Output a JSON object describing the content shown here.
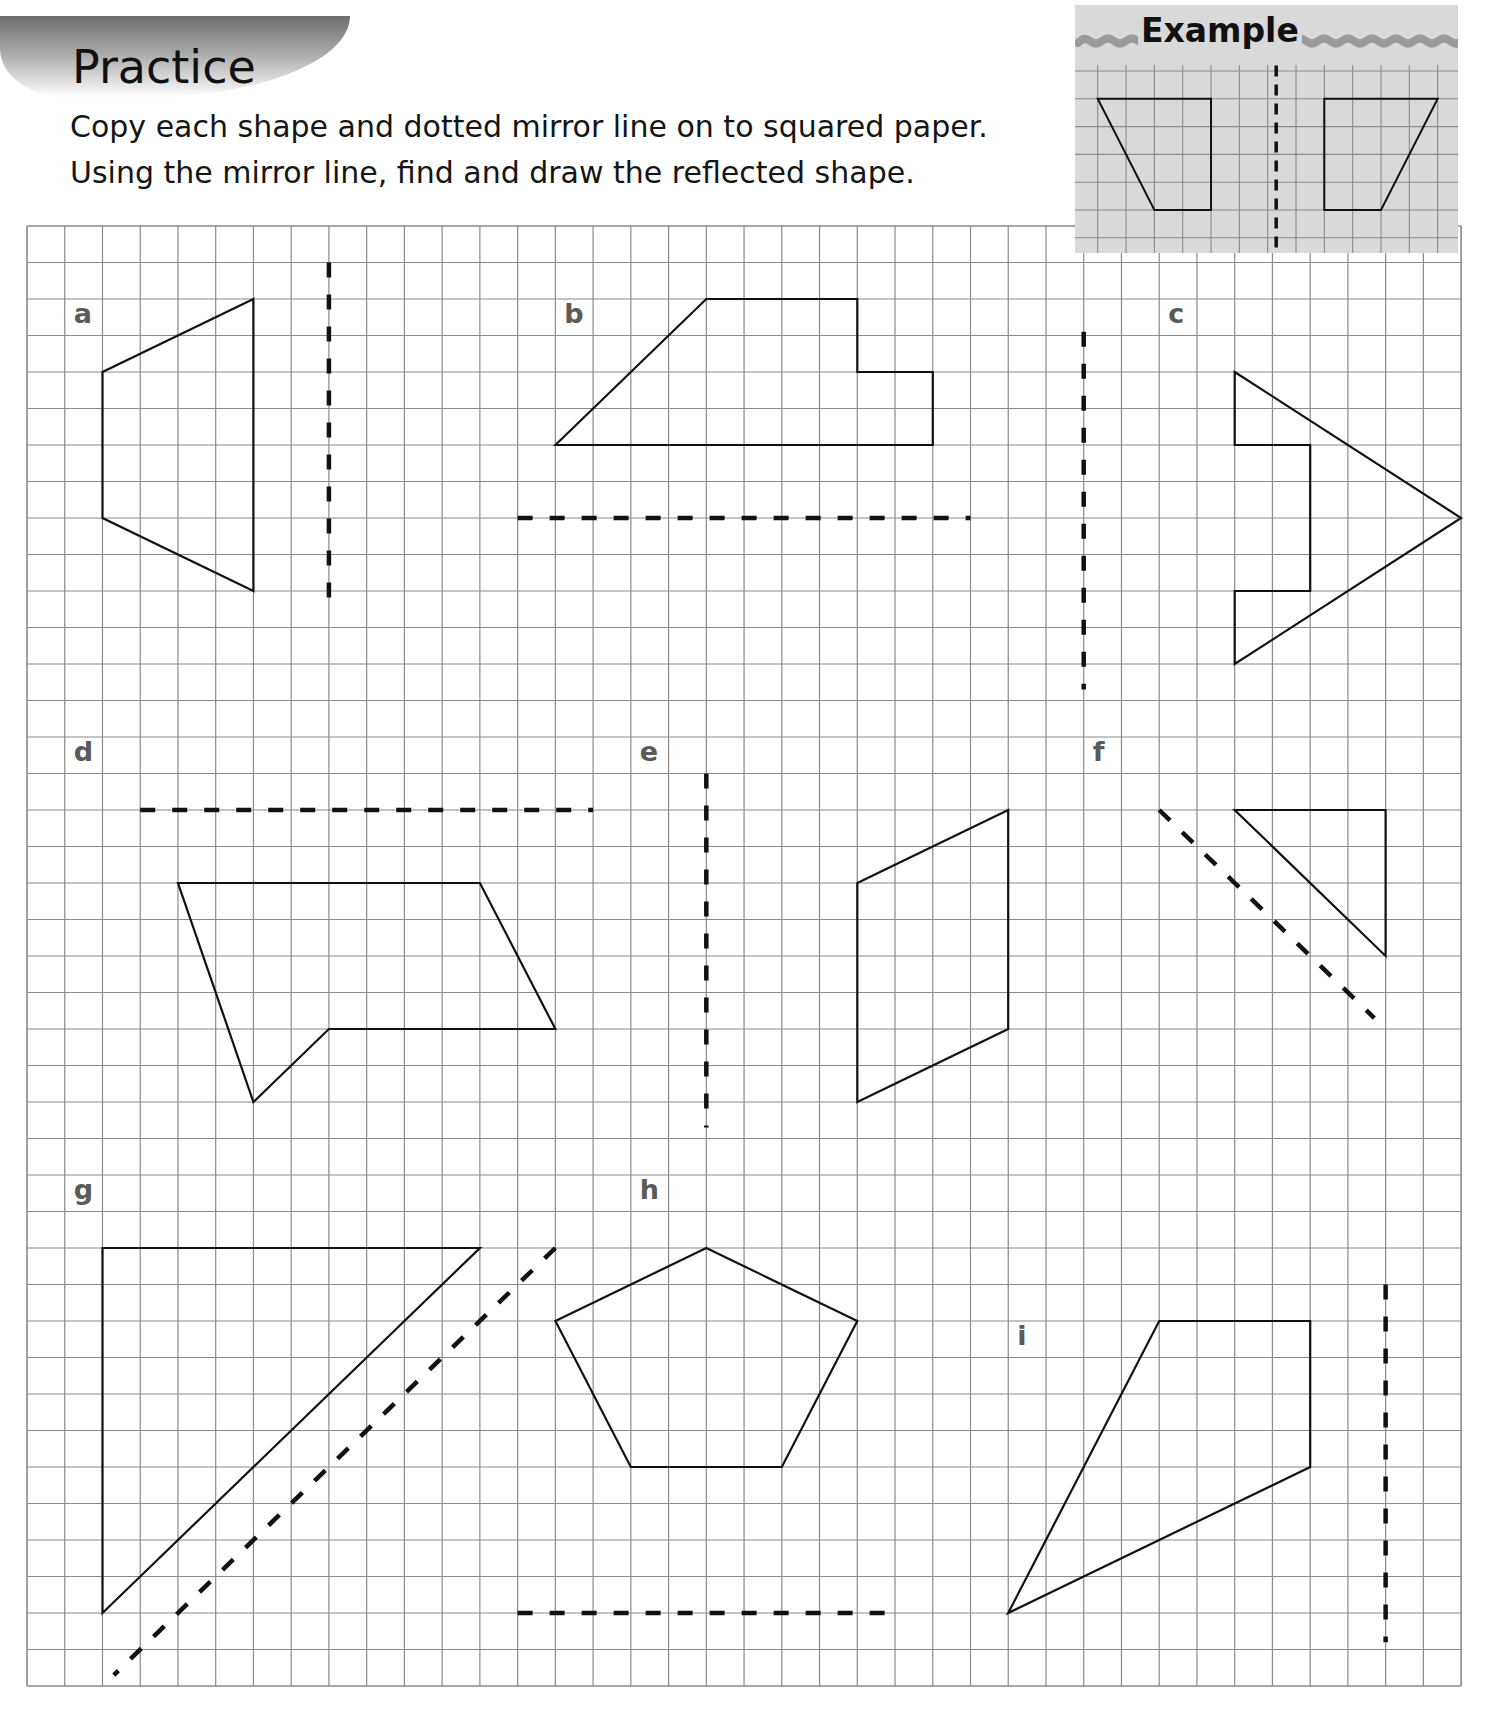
{
  "header": {
    "title": "Practice",
    "instructions": [
      "Copy each shape and dotted mirror line on to squared paper.",
      "Using the mirror line, find and draw the reflected shape."
    ]
  },
  "example": {
    "title": "Example",
    "grid": {
      "cols": 13,
      "rows": 7
    },
    "original_shape": [
      [
        0,
        1
      ],
      [
        4,
        1
      ],
      [
        4,
        5
      ],
      [
        2,
        5
      ]
    ],
    "reflected_shape": [
      [
        8,
        1
      ],
      [
        12,
        1
      ],
      [
        10,
        5
      ],
      [
        8,
        5
      ]
    ],
    "mirror_line": {
      "from": [
        6.3,
        -0.2
      ],
      "to": [
        6.3,
        6.5
      ]
    }
  },
  "grid": {
    "cols": 38,
    "rows": 40,
    "line_color": "#8a8a8a"
  },
  "colors": {
    "shape_stroke": "#111111",
    "mirror_stroke": "#111111",
    "label": "#5a5a5a",
    "example_bg": "#d9d9d9"
  },
  "exercises": [
    {
      "label": "a",
      "label_cell": [
        1,
        2
      ],
      "shape": [
        [
          6,
          2
        ],
        [
          6,
          10
        ],
        [
          2,
          8
        ],
        [
          2,
          4
        ]
      ],
      "mirror_line": {
        "from": [
          8,
          1
        ],
        "to": [
          8,
          10.6
        ]
      }
    },
    {
      "label": "b",
      "label_cell": [
        14,
        2
      ],
      "shape": [
        [
          14,
          6
        ],
        [
          18,
          2
        ],
        [
          22,
          2
        ],
        [
          22,
          4
        ],
        [
          24,
          4
        ],
        [
          24,
          6
        ]
      ],
      "mirror_line": {
        "from": [
          13,
          8
        ],
        "to": [
          25,
          8
        ]
      }
    },
    {
      "label": "c",
      "label_cell": [
        30,
        2
      ],
      "shape": [
        [
          32,
          4
        ],
        [
          38,
          8
        ],
        [
          32,
          12
        ],
        [
          32,
          10
        ],
        [
          34,
          10
        ],
        [
          34,
          6
        ],
        [
          32,
          6
        ]
      ],
      "mirror_line": {
        "from": [
          28,
          2.9
        ],
        "to": [
          28,
          12.7
        ]
      }
    },
    {
      "label": "d",
      "label_cell": [
        1,
        14
      ],
      "shape": [
        [
          4,
          18
        ],
        [
          12,
          18
        ],
        [
          14,
          22
        ],
        [
          8,
          22
        ],
        [
          6,
          24
        ]
      ],
      "mirror_line": {
        "from": [
          3,
          16
        ],
        "to": [
          15,
          16
        ]
      }
    },
    {
      "label": "e",
      "label_cell": [
        16,
        14
      ],
      "shape": [
        [
          22,
          18
        ],
        [
          26,
          16
        ],
        [
          26,
          22
        ],
        [
          22,
          24
        ]
      ],
      "mirror_line": {
        "from": [
          18,
          15
        ],
        "to": [
          18,
          24.7
        ]
      }
    },
    {
      "label": "f",
      "label_cell": [
        28,
        14
      ],
      "shape": [
        [
          32,
          16
        ],
        [
          36,
          16
        ],
        [
          36,
          20
        ]
      ],
      "mirror_line": {
        "from": [
          30,
          16
        ],
        "to": [
          35.7,
          21.7
        ]
      }
    },
    {
      "label": "g",
      "label_cell": [
        1,
        26
      ],
      "shape": [
        [
          2,
          28
        ],
        [
          12,
          28
        ],
        [
          2,
          38
        ]
      ],
      "mirror_line": {
        "from": [
          14,
          28
        ],
        "to": [
          2.3,
          39.7
        ]
      }
    },
    {
      "label": "h",
      "label_cell": [
        16,
        26
      ],
      "shape": [
        [
          18,
          28
        ],
        [
          22,
          30
        ],
        [
          20,
          34
        ],
        [
          16,
          34
        ],
        [
          14,
          30
        ]
      ],
      "mirror_line": {
        "from": [
          13,
          38
        ],
        "to": [
          22.8,
          38
        ]
      }
    },
    {
      "label": "i",
      "label_cell": [
        26,
        30
      ],
      "shape": [
        [
          30,
          30
        ],
        [
          34,
          30
        ],
        [
          34,
          34
        ],
        [
          26,
          38
        ]
      ],
      "mirror_line": {
        "from": [
          36,
          29
        ],
        "to": [
          36,
          38.8
        ]
      }
    }
  ]
}
